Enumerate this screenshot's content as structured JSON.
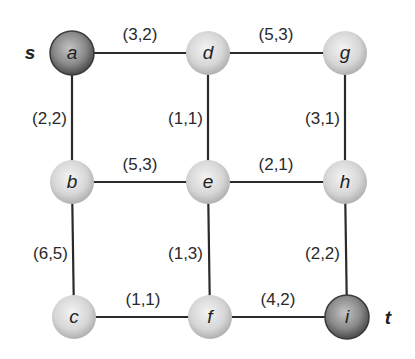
{
  "graph": {
    "nodes": [
      {
        "id": "a",
        "label": "a",
        "x": 72,
        "y": 53,
        "style": "dark"
      },
      {
        "id": "d",
        "label": "d",
        "x": 208,
        "y": 53,
        "style": "light"
      },
      {
        "id": "g",
        "label": "g",
        "x": 345,
        "y": 53,
        "style": "light"
      },
      {
        "id": "b",
        "label": "b",
        "x": 72,
        "y": 182,
        "style": "light"
      },
      {
        "id": "e",
        "label": "e",
        "x": 208,
        "y": 182,
        "style": "light"
      },
      {
        "id": "h",
        "label": "h",
        "x": 345,
        "y": 182,
        "style": "light"
      },
      {
        "id": "c",
        "label": "c",
        "x": 74,
        "y": 317,
        "style": "light"
      },
      {
        "id": "f",
        "label": "f",
        "x": 210,
        "y": 317,
        "style": "light"
      },
      {
        "id": "i",
        "label": "i",
        "x": 347,
        "y": 317,
        "style": "dark"
      }
    ],
    "edges": [
      {
        "from": "a",
        "to": "d",
        "label": "(3,2)",
        "lx": 140,
        "ly": 40,
        "anchor": "middle"
      },
      {
        "from": "d",
        "to": "g",
        "label": "(5,3)",
        "lx": 276,
        "ly": 40,
        "anchor": "middle"
      },
      {
        "from": "a",
        "to": "b",
        "label": "(2,2)",
        "lx": 67,
        "ly": 124,
        "anchor": "end"
      },
      {
        "from": "d",
        "to": "e",
        "label": "(1,1)",
        "lx": 203,
        "ly": 124,
        "anchor": "end"
      },
      {
        "from": "g",
        "to": "h",
        "label": "(3,1)",
        "lx": 340,
        "ly": 124,
        "anchor": "end"
      },
      {
        "from": "b",
        "to": "e",
        "label": "(5,3)",
        "lx": 140,
        "ly": 170,
        "anchor": "middle"
      },
      {
        "from": "e",
        "to": "h",
        "label": "(2,1)",
        "lx": 276,
        "ly": 170,
        "anchor": "middle"
      },
      {
        "from": "b",
        "to": "c",
        "label": "(6,5)",
        "lx": 68,
        "ly": 259,
        "anchor": "end"
      },
      {
        "from": "e",
        "to": "f",
        "label": "(1,3)",
        "lx": 203,
        "ly": 259,
        "anchor": "end"
      },
      {
        "from": "h",
        "to": "i",
        "label": "(2,2)",
        "lx": 340,
        "ly": 259,
        "anchor": "end"
      },
      {
        "from": "c",
        "to": "f",
        "label": "(1,1)",
        "lx": 143,
        "ly": 305,
        "anchor": "middle"
      },
      {
        "from": "f",
        "to": "i",
        "label": "(4,2)",
        "lx": 278,
        "ly": 305,
        "anchor": "middle"
      }
    ],
    "source_label": "s",
    "sink_label": "t"
  },
  "colors": {
    "light_node_center": "#f2f2f2",
    "light_node_edge": "#b5b5b5",
    "dark_node_center": "#b0b0b0",
    "dark_node_edge": "#505050",
    "edge": "#2a2a2a"
  }
}
